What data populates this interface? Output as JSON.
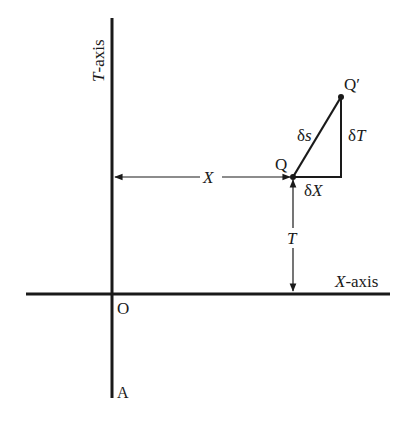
{
  "diagram": {
    "axes": {
      "t_axis_label_italic": "T",
      "t_axis_label_rest": "-axis",
      "x_axis_label_italic": "X",
      "x_axis_label_rest": "-axis",
      "origin_label": "O",
      "bottom_label": "A"
    },
    "points": {
      "q_label": "Q",
      "q_prime_label": "Q′"
    },
    "dimensions": {
      "x_distance_label": "X",
      "t_distance_label": "T"
    },
    "triangle": {
      "ds_delta": "δ",
      "ds_var": "s",
      "dt_delta": "δ",
      "dt_var": "T",
      "dx_delta": "δ",
      "dx_var": "X"
    },
    "colors": {
      "ink": "#1a1a1a",
      "background": "#ffffff"
    }
  }
}
